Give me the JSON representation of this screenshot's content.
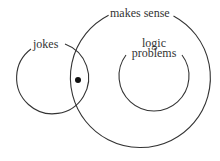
{
  "diagram": {
    "type": "venn",
    "colors": {
      "stroke": "#333333",
      "text": "#333333",
      "background": "#ffffff",
      "dot": "#111111"
    },
    "sets": [
      {
        "id": "makes_sense",
        "label": "makes sense"
      },
      {
        "id": "jokes",
        "label": "jokes"
      },
      {
        "id": "logic_problems",
        "label_line1": "logic",
        "label_line2": "problems"
      }
    ],
    "marker": {
      "description": "dot in intersection of jokes and makes sense"
    }
  }
}
